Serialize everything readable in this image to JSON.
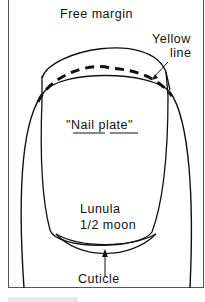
{
  "diagram": {
    "type": "labeled anatomical line drawing",
    "labels": {
      "free_margin": "Free margin",
      "yellow_line_1": "Yellow",
      "yellow_line_2": "line",
      "nail_plate": "\"Nail plate\"",
      "lunula_1": "Lunula",
      "lunula_2": "1/2 moon",
      "cuticle": "Cuticle"
    },
    "colors": {
      "line": "#111111",
      "frame": "#555555",
      "background": "#ffffff"
    }
  }
}
